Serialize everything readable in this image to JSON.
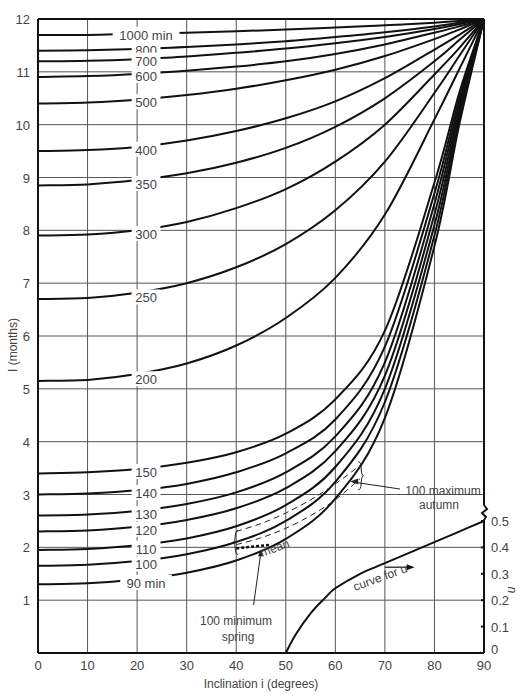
{
  "chart_data": {
    "type": "line",
    "title": "",
    "xlabel": "Inclination i (degrees)",
    "ylabel": "I (months)",
    "y2label": "u",
    "xlim": [
      0,
      90
    ],
    "ylim": [
      0,
      12
    ],
    "y2lim": [
      0,
      0.5
    ],
    "grid": true,
    "xticks": [
      "0",
      "10",
      "20",
      "30",
      "40",
      "50",
      "60",
      "70",
      "80",
      "90"
    ],
    "yticks": [
      "1",
      "2",
      "3",
      "4",
      "5",
      "6",
      "7",
      "8",
      "9",
      "10",
      "11",
      "12"
    ],
    "y2ticks": [
      "0",
      "0.1",
      "0.2",
      "0.3",
      "0.4",
      "0.5"
    ],
    "x": [
      0,
      10,
      20,
      30,
      40,
      50,
      60,
      70,
      80,
      85,
      90
    ],
    "series": [
      {
        "name": "1000 min",
        "label": "1000 min",
        "label_i": 21,
        "values": [
          11.7,
          11.7,
          11.72,
          11.74,
          11.77,
          11.8,
          11.84,
          11.88,
          11.93,
          11.96,
          12
        ]
      },
      {
        "name": "800",
        "label": "800",
        "label_i": 21,
        "values": [
          11.4,
          11.41,
          11.43,
          11.47,
          11.52,
          11.58,
          11.66,
          11.75,
          11.86,
          11.93,
          12
        ]
      },
      {
        "name": "700",
        "label": "700",
        "label_i": 21,
        "values": [
          11.2,
          11.21,
          11.24,
          11.29,
          11.36,
          11.44,
          11.54,
          11.66,
          11.81,
          11.9,
          12
        ]
      },
      {
        "name": "600",
        "label": "600",
        "label_i": 21,
        "values": [
          10.9,
          10.92,
          10.96,
          11.02,
          11.1,
          11.2,
          11.34,
          11.52,
          11.74,
          11.86,
          12
        ]
      },
      {
        "name": "500",
        "label": "500",
        "label_i": 21,
        "values": [
          10.4,
          10.42,
          10.47,
          10.56,
          10.68,
          10.84,
          11.04,
          11.3,
          11.62,
          11.8,
          12
        ]
      },
      {
        "name": "400",
        "label": "400",
        "label_i": 21,
        "values": [
          9.5,
          9.52,
          9.58,
          9.7,
          9.88,
          10.12,
          10.44,
          10.88,
          11.42,
          11.7,
          12
        ]
      },
      {
        "name": "350",
        "label": "350",
        "label_i": 21,
        "values": [
          8.85,
          8.87,
          8.95,
          9.08,
          9.28,
          9.56,
          9.96,
          10.5,
          11.2,
          11.6,
          12
        ]
      },
      {
        "name": "300",
        "label": "300",
        "label_i": 21,
        "values": [
          7.9,
          7.92,
          8.0,
          8.16,
          8.42,
          8.78,
          9.3,
          10.0,
          10.95,
          11.45,
          12
        ]
      },
      {
        "name": "250",
        "label": "250",
        "label_i": 21,
        "values": [
          6.7,
          6.72,
          6.82,
          7.0,
          7.3,
          7.74,
          8.38,
          9.3,
          10.6,
          11.3,
          12
        ]
      },
      {
        "name": "200",
        "label": "200",
        "label_i": 21,
        "values": [
          5.15,
          5.17,
          5.28,
          5.48,
          5.82,
          6.34,
          7.1,
          8.3,
          10.1,
          11.05,
          12
        ]
      },
      {
        "name": "150",
        "label": "150",
        "label_i": 21,
        "values": [
          3.4,
          3.42,
          3.48,
          3.6,
          3.8,
          4.15,
          4.8,
          6.1,
          8.9,
          10.6,
          12
        ]
      },
      {
        "name": "140",
        "label": "140",
        "label_i": 21,
        "values": [
          3.0,
          3.02,
          3.08,
          3.2,
          3.42,
          3.78,
          4.42,
          5.8,
          8.7,
          10.5,
          12
        ]
      },
      {
        "name": "130",
        "label": "130",
        "label_i": 21,
        "values": [
          2.6,
          2.62,
          2.69,
          2.82,
          3.04,
          3.42,
          4.1,
          5.5,
          8.5,
          10.4,
          12
        ]
      },
      {
        "name": "120",
        "label": "120",
        "label_i": 21,
        "values": [
          2.3,
          2.32,
          2.39,
          2.52,
          2.74,
          3.12,
          3.82,
          5.25,
          8.3,
          10.3,
          12
        ]
      },
      {
        "name": "110",
        "label": "110",
        "label_i": 21,
        "values": [
          1.95,
          1.97,
          2.04,
          2.17,
          2.4,
          2.8,
          3.52,
          5.0,
          8.1,
          10.2,
          12
        ]
      },
      {
        "name": "100",
        "label": "100",
        "label_i": 21,
        "values": [
          1.65,
          1.67,
          1.74,
          1.87,
          2.1,
          2.5,
          3.24,
          4.75,
          7.9,
          10.1,
          12
        ]
      },
      {
        "name": "90 min",
        "label": "90 min",
        "label_i": 21,
        "values": [
          1.3,
          1.32,
          1.39,
          1.52,
          1.75,
          2.16,
          2.92,
          4.45,
          7.7,
          10.0,
          12
        ]
      }
    ],
    "u_curve": {
      "name": "curve for u",
      "x": [
        50,
        52,
        55,
        58,
        60,
        65,
        70,
        75,
        80,
        85,
        90
      ],
      "u": [
        0.0,
        0.07,
        0.15,
        0.21,
        0.245,
        0.3,
        0.34,
        0.38,
        0.42,
        0.46,
        0.5
      ]
    },
    "mean_band": {
      "label": "mean",
      "x": [
        40,
        45,
        50,
        55,
        60,
        65
      ],
      "upper": [
        2.3,
        2.45,
        2.65,
        2.9,
        3.2,
        3.55
      ],
      "lower": [
        2.05,
        2.18,
        2.36,
        2.6,
        2.9,
        3.3
      ]
    },
    "annotations": [
      {
        "text_line1": "100 minimum",
        "text_line2": "spring",
        "i": 43.5,
        "I": 0.7
      },
      {
        "text_line1": "100 maximum",
        "text_line2": "autumn",
        "i": 75.5,
        "I": 2.95
      },
      {
        "text": "curve for u",
        "i": 64,
        "I": 1.7
      },
      {
        "text": "mean",
        "i": 53,
        "I": 2.45
      }
    ]
  },
  "labels": {
    "xlabel": "Inclination i (degrees)",
    "ylabel": "I (months)",
    "y2label": "u",
    "mean": "mean",
    "curve_u": "curve for u",
    "min_spring_1": "100 minimum",
    "min_spring_2": "spring",
    "max_autumn_1": "100 maximum",
    "max_autumn_2": "autumn"
  }
}
